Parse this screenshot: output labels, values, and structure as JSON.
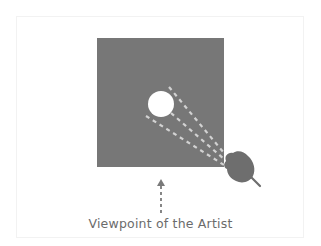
{
  "diagram": {
    "caption": "Viewpoint of the Artist",
    "colors": {
      "canvas": "#777777",
      "object": "#ffffff",
      "sight_lines": "#d2d2d2",
      "viewer": "#6e6e6e",
      "arrow": "#7a7a7a",
      "caption_text": "#6b6b6b"
    },
    "elements": {
      "canvas_square": "gray square representing the canvas/picture plane",
      "object_circle": "white circle representing the observed object",
      "sight_lines": "three dashed lines from the object to the viewer's eye",
      "viewer_head": "gray head silhouette at lower-right corner",
      "viewpoint_arrow": "dashed upward arrow pointing at the canvas"
    }
  }
}
